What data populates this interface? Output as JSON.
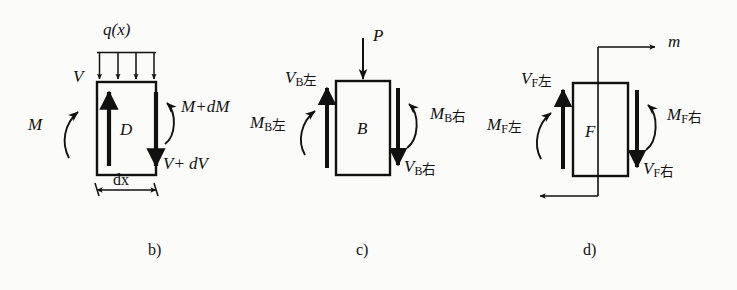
{
  "figure": {
    "kind": "engineering-free-body-diagrams",
    "background_color": "#fbfbf9",
    "ink_color": "#111111",
    "panels": [
      {
        "id": "b",
        "caption": "b)",
        "body_letter": "D",
        "description": "Differential beam element under distributed load q(x)",
        "labels": {
          "distributed_load": "q(x)",
          "shear_left": "V",
          "moment_left": "M",
          "moment_right": "M+dM",
          "shear_right": "V+ dV",
          "width_dimension": "dx"
        }
      },
      {
        "id": "c",
        "caption": "c)",
        "body_letter": "B",
        "description": "Beam element at concentrated force P",
        "labels": {
          "point_load": "P",
          "shear_left": "V",
          "shear_left_sub": "B",
          "shear_left_sub_cn": "左",
          "moment_left": "M",
          "moment_left_sub": "B",
          "moment_left_sub_cn": "左",
          "moment_right": "M",
          "moment_right_sub": "B",
          "moment_right_sub_cn": "右",
          "shear_right": "V",
          "shear_right_sub": "B",
          "shear_right_sub_cn": "右"
        }
      },
      {
        "id": "d",
        "caption": "d)",
        "body_letter": "F",
        "description": "Beam element at concentrated couple m",
        "labels": {
          "couple_moment": "m",
          "shear_left": "V",
          "shear_left_sub": "F",
          "shear_left_sub_cn": "左",
          "moment_left": "M",
          "moment_left_sub": "F",
          "moment_left_sub_cn": "左",
          "moment_right": "M",
          "moment_right_sub": "F",
          "moment_right_sub_cn": "右",
          "shear_right": "V",
          "shear_right_sub": "F",
          "shear_right_sub_cn": "右"
        }
      }
    ]
  }
}
